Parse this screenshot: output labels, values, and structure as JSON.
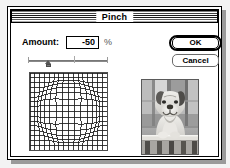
{
  "window": {
    "title": "Pinch"
  },
  "controls": {
    "amount_label": "Amount:",
    "amount_value": "-50",
    "amount_unit": "%",
    "amount_placeholder": "0",
    "slider": {
      "name": "amount-slider",
      "min": -100,
      "max": 100,
      "value": -50
    }
  },
  "buttons": {
    "ok_label": "OK",
    "cancel_label": "Cancel"
  },
  "previews": {
    "mesh": {
      "name": "pinch-mesh-preview",
      "type": "warp-grid",
      "cells": 16,
      "distortion": "bulge",
      "amount": -50
    },
    "image": {
      "name": "image-preview",
      "subject": "bulldog behind railing",
      "mode": "grayscale"
    }
  },
  "colors": {
    "window_background": "#ffffff",
    "desktop_background": "#f3f3f3",
    "border": "#000000",
    "shadow": "#9a9a9a",
    "grid_line": "#1a1a1a"
  }
}
